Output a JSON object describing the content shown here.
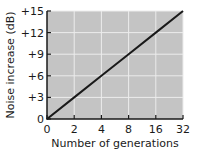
{
  "chart_data": {
    "type": "line",
    "title": "",
    "xlabel": "Number of generations",
    "ylabel": "Noise increase (dB)",
    "x_tick_labels": [
      "0",
      "2",
      "4",
      "8",
      "16",
      "32"
    ],
    "y_tick_labels": [
      "0",
      "+3",
      "+6",
      "+9",
      "+12",
      "+15"
    ],
    "x_scale": "log2 (0 at origin, doubling per equal step)",
    "ylim": [
      0,
      15
    ],
    "grid": true,
    "legend": "none",
    "series": [
      {
        "name": "Noise increase",
        "x": [
          0,
          2,
          4,
          8,
          16,
          32
        ],
        "values": [
          0,
          3,
          6,
          9,
          12,
          15
        ]
      }
    ],
    "colors": {
      "plot_background": "#c4c4c4",
      "gridline": "#ececec",
      "line": "#1a1a1a",
      "axis": "#1a1a1a"
    }
  }
}
